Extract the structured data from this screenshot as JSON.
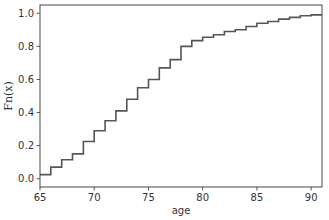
{
  "chart_data": {
    "type": "line",
    "subtype": "ecdf-step",
    "title": "",
    "xlabel": "age",
    "ylabel": "Fn(x)",
    "xlim": [
      65,
      91
    ],
    "ylim": [
      -0.05,
      1.05
    ],
    "xticks": [
      65,
      70,
      75,
      80,
      85,
      90
    ],
    "yticks": [
      0.0,
      0.2,
      0.4,
      0.6,
      0.8,
      1.0
    ],
    "xtick_labels": [
      "65",
      "70",
      "75",
      "80",
      "85",
      "90"
    ],
    "ytick_labels": [
      "0.0",
      "0.2",
      "0.4",
      "0.6",
      "0.8",
      "1.0"
    ],
    "grid": false,
    "legend": null,
    "series": [
      {
        "name": "Fn(x)",
        "color": "#555555",
        "x": [
          65,
          66,
          67,
          68,
          69,
          70,
          71,
          72,
          73,
          74,
          75,
          76,
          77,
          78,
          79,
          80,
          81,
          82,
          83,
          84,
          85,
          86,
          87,
          88,
          89,
          90,
          91
        ],
        "values": [
          0.025,
          0.07,
          0.115,
          0.15,
          0.225,
          0.29,
          0.35,
          0.41,
          0.48,
          0.55,
          0.6,
          0.67,
          0.72,
          0.8,
          0.835,
          0.855,
          0.87,
          0.89,
          0.9,
          0.92,
          0.94,
          0.95,
          0.965,
          0.975,
          0.985,
          0.99,
          0.99
        ]
      }
    ]
  },
  "layout": {
    "plot_left": 40,
    "plot_right": 322,
    "plot_top": 5,
    "plot_bottom": 187
  }
}
